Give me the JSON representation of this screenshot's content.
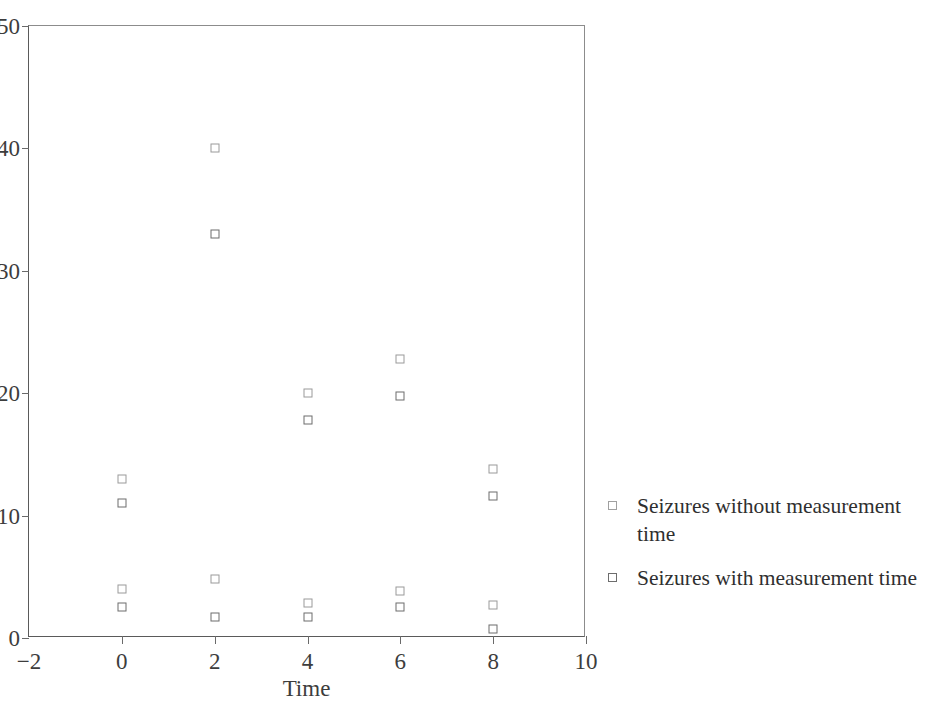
{
  "chart_data": {
    "type": "scatter",
    "title": "",
    "xlabel": "Time",
    "ylabel": "",
    "xlim": [
      -2,
      10
    ],
    "ylim": [
      0,
      50
    ],
    "xticks": [
      -2,
      0,
      2,
      4,
      6,
      8,
      10
    ],
    "xtick_labels": [
      "−2",
      "0",
      "2",
      "4",
      "6",
      "8",
      "10"
    ],
    "yticks": [
      0,
      10,
      20,
      30,
      40,
      50
    ],
    "ytick_labels": [
      "0",
      "10",
      "20",
      "30",
      "40",
      "50"
    ],
    "grid": false,
    "legend_position": "right",
    "marker": "open-square",
    "series": [
      {
        "name": "Seizures without measurement time",
        "marker": "open-square",
        "color": "#9a9a9a",
        "points": [
          {
            "x": 0,
            "y": 13
          },
          {
            "x": 0,
            "y": 4
          },
          {
            "x": 2,
            "y": 40
          },
          {
            "x": 2,
            "y": 4.8
          },
          {
            "x": 4,
            "y": 20
          },
          {
            "x": 4,
            "y": 2.9
          },
          {
            "x": 6,
            "y": 22.8
          },
          {
            "x": 6,
            "y": 3.8
          },
          {
            "x": 8,
            "y": 13.8
          },
          {
            "x": 8,
            "y": 2.7
          }
        ]
      },
      {
        "name": "Seizures with measurement time",
        "marker": "open-square",
        "color": "#6d6d6d",
        "points": [
          {
            "x": 0,
            "y": 11
          },
          {
            "x": 0,
            "y": 2.5
          },
          {
            "x": 2,
            "y": 33
          },
          {
            "x": 2,
            "y": 1.7
          },
          {
            "x": 4,
            "y": 17.8
          },
          {
            "x": 4,
            "y": 1.7
          },
          {
            "x": 6,
            "y": 19.8
          },
          {
            "x": 6,
            "y": 2.5
          },
          {
            "x": 8,
            "y": 11.6
          },
          {
            "x": 8,
            "y": 0.7
          }
        ]
      }
    ]
  },
  "legend": {
    "entries": [
      {
        "label": "Seizures without measurement time"
      },
      {
        "label": "Seizures with measurement time"
      }
    ]
  },
  "axis": {
    "x_title": "Time"
  }
}
